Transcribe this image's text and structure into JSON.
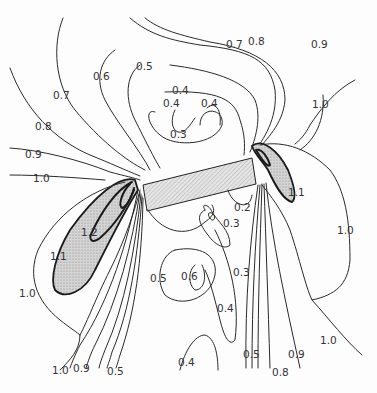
{
  "figure": {
    "type": "contour-plot",
    "plate_fill": "hatched-gray",
    "high_region_fill": "stippled-gray",
    "line_color": "#2a2a2a"
  },
  "labels": {
    "top_07_left": "0.7",
    "top_08": "0.8",
    "top_09": "0.9",
    "top_06": "0.6",
    "top_05": "0.5",
    "left_07": "0.7",
    "left_08": "0.8",
    "left_09": "0.9",
    "left_10": "1.0",
    "center_04_a": "0.4",
    "center_04_b": "0.4",
    "center_04_c": "0.4",
    "center_03": "0.3",
    "right_10_top": "1.0",
    "right_11": "1.1",
    "left_12": "1.2",
    "left_11": "1.1",
    "left_10_mid": "1.0",
    "lower_02": "0.2",
    "lower_03_a": "0.3",
    "lower_03_b": "0.3",
    "lower_05": "0.5",
    "lower_06": "0.6",
    "lower_04": "0.4",
    "right_10_mid": "1.0",
    "right_10_low": "1.0",
    "bottom_10": "1.0",
    "bottom_09_left": "0.9",
    "bottom_05_left": "0.5",
    "bottom_04": "0.4",
    "bottom_05_right": "0.5",
    "bottom_08": "0.8",
    "bottom_09_right": "0.9"
  }
}
